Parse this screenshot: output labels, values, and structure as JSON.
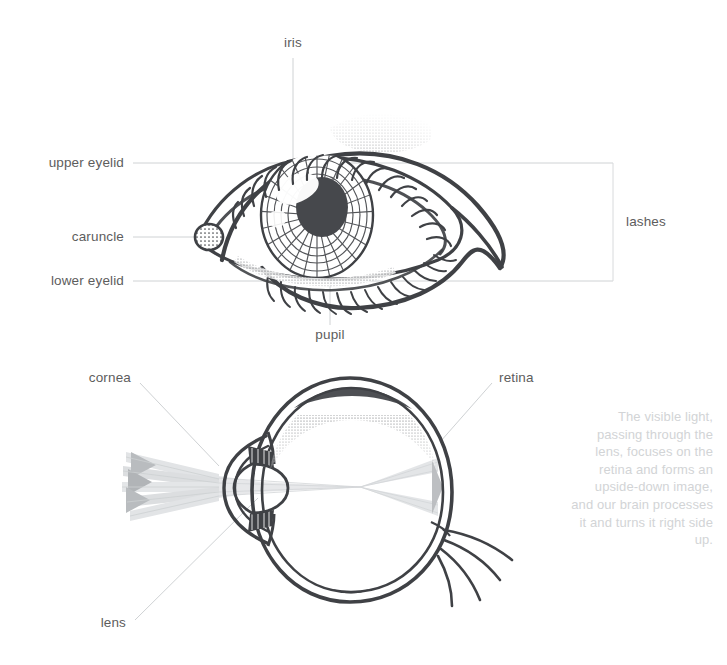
{
  "document": {
    "title": "Human Eye Anatomy Diagram",
    "background_color": "#ffffff",
    "ink_color": "#3f4145",
    "label_color": "#5d5d5d",
    "leader_color": "#cfd2d4",
    "caption_color": "#d2d4d6",
    "ray_color": "#d9dbdd"
  },
  "diagrams": [
    {
      "id": "external-eye",
      "name": "External eye front view",
      "labels": [
        {
          "key": "iris",
          "text": "iris",
          "align": "center"
        },
        {
          "key": "upper_eyelid",
          "text": "upper eyelid",
          "align": "right"
        },
        {
          "key": "caruncle",
          "text": "caruncle",
          "align": "right"
        },
        {
          "key": "lower_eyelid",
          "text": "lower eyelid",
          "align": "right"
        },
        {
          "key": "pupil",
          "text": "pupil",
          "align": "center"
        },
        {
          "key": "lashes",
          "text": "lashes",
          "align": "left"
        }
      ]
    },
    {
      "id": "eye-cross-section",
      "name": "Eye cross section with light rays",
      "labels": [
        {
          "key": "cornea",
          "text": "cornea",
          "align": "right"
        },
        {
          "key": "retina",
          "text": "retina",
          "align": "left"
        },
        {
          "key": "lens",
          "text": "lens",
          "align": "right"
        }
      ]
    }
  ],
  "labels": {
    "iris": "iris",
    "upper_eyelid": "upper eyelid",
    "caruncle": "caruncle",
    "lower_eyelid": "lower eyelid",
    "pupil": "pupil",
    "lashes": "lashes",
    "cornea": "cornea",
    "retina": "retina",
    "lens": "lens"
  },
  "caption": {
    "text": "The visible light, passing through the lens, focuses on the retina and forms an upside-down image, and our brain processes it and turns it right side up.",
    "lines": [
      "The visible light,",
      "passing through the",
      "lens, focuses on the",
      "retina and forms",
      "an upside-down",
      "image, and our brain",
      "processes it and turns",
      "it right side up."
    ]
  }
}
